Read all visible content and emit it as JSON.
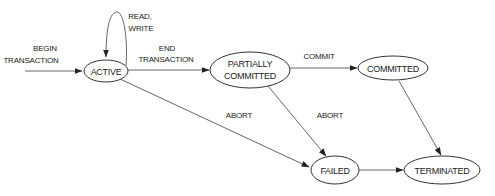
{
  "diagram": {
    "type": "state-transition",
    "states": [
      {
        "id": "active",
        "label": "ACTIVE"
      },
      {
        "id": "partially_committed",
        "label_line1": "PARTIALLY",
        "label_line2": "COMMITTED"
      },
      {
        "id": "committed",
        "label": "COMMITTED"
      },
      {
        "id": "failed",
        "label": "FAILED"
      },
      {
        "id": "terminated",
        "label": "TERMINATED"
      }
    ],
    "transitions": [
      {
        "from": "start",
        "to": "active",
        "label_line1": "BEGIN",
        "label_line2": "TRANSACTION"
      },
      {
        "from": "active",
        "to": "active",
        "label_line1": "READ,",
        "label_line2": "WRITE"
      },
      {
        "from": "active",
        "to": "partially_committed",
        "label_line1": "END",
        "label_line2": "TRANSACTION"
      },
      {
        "from": "partially_committed",
        "to": "committed",
        "label": "COMMIT"
      },
      {
        "from": "active",
        "to": "failed",
        "label": "ABORT"
      },
      {
        "from": "partially_committed",
        "to": "failed",
        "label": "ABORT"
      },
      {
        "from": "committed",
        "to": "terminated",
        "label": ""
      },
      {
        "from": "failed",
        "to": "terminated",
        "label": ""
      }
    ]
  }
}
